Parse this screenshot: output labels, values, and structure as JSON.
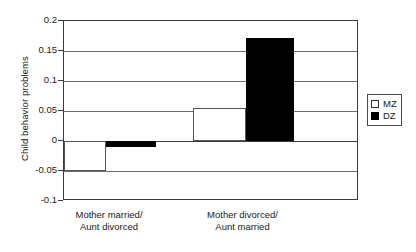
{
  "chart_data": {
    "type": "bar",
    "title": "",
    "xlabel": "",
    "ylabel": "Child behavior problems",
    "ylim": [
      -0.1,
      0.2
    ],
    "yticks": [
      "0.2",
      "0.15",
      "0.1",
      "0.05",
      "0",
      "-0.05",
      "-0.1"
    ],
    "ytick_values": [
      0.2,
      0.15,
      0.1,
      0.05,
      0,
      -0.05,
      -0.1
    ],
    "grid": true,
    "legend_position": "right",
    "categories": [
      "Mother married/\nAunt divorced",
      "Mother divorced/\nAunt married"
    ],
    "series": [
      {
        "name": "MZ",
        "color": "#ffffff",
        "values": [
          -0.05,
          0.055
        ]
      },
      {
        "name": "DZ",
        "color": "#000000",
        "values": [
          -0.01,
          0.172
        ]
      }
    ]
  },
  "legend": {
    "items": [
      {
        "label": "MZ"
      },
      {
        "label": "DZ"
      }
    ]
  }
}
